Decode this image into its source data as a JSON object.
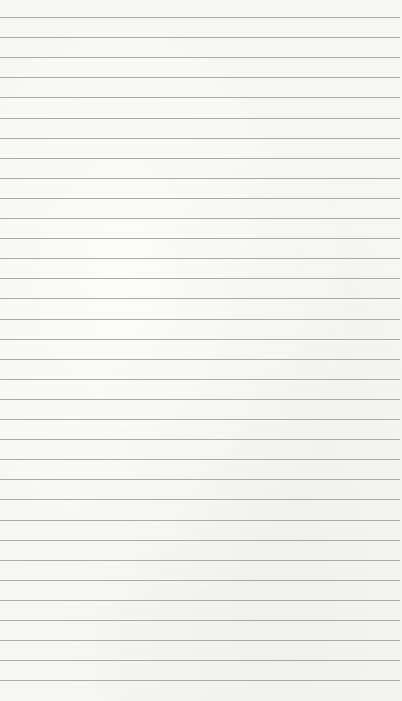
{
  "paper": {
    "type": "lined-notebook-page",
    "background_color": "#f6f6f4",
    "line_color": "#9c9c9a",
    "line_count": 34,
    "first_line_y": 17,
    "line_spacing": 20.1,
    "text_content": ""
  }
}
